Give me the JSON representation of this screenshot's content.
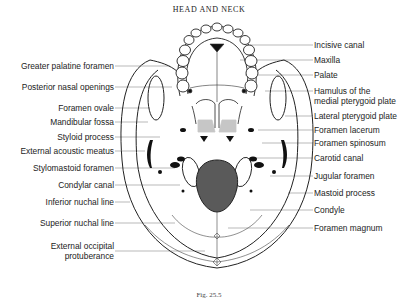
{
  "header": {
    "title": "HEAD AND NECK"
  },
  "caption": "Fig. 25.5",
  "labels_left": [
    {
      "text": "Greater palatine foramen",
      "y": 61
    },
    {
      "text": "Posterior nasal openings",
      "y": 82
    },
    {
      "text": "Foramen ovale",
      "y": 103
    },
    {
      "text": "Mandibular fossa",
      "y": 117
    },
    {
      "text": "Styloid process",
      "y": 132
    },
    {
      "text": "External acoustic meatus",
      "y": 146
    },
    {
      "text": "Stylomastoid foramen",
      "y": 163
    },
    {
      "text": "Condylar canal",
      "y": 180
    },
    {
      "text": "Inferior nuchal line",
      "y": 197
    },
    {
      "text": "Superior nuchal line",
      "y": 218
    },
    {
      "text": "External occipital",
      "y": 241
    },
    {
      "text": "protuberance",
      "y": 251
    }
  ],
  "labels_right": [
    {
      "text": "Incisive canal",
      "y": 40
    },
    {
      "text": "Maxilla",
      "y": 55
    },
    {
      "text": "Palate",
      "y": 70
    },
    {
      "text": "Hamulus of the",
      "y": 86
    },
    {
      "text": "medial pterygoid plate",
      "y": 96
    },
    {
      "text": "Lateral pterygoid plate",
      "y": 111
    },
    {
      "text": "Foramen lacerum",
      "y": 125
    },
    {
      "text": "Foramen spinosum",
      "y": 138
    },
    {
      "text": "Carotid canal",
      "y": 153
    },
    {
      "text": "Jugular foramen",
      "y": 171
    },
    {
      "text": "Mastoid process",
      "y": 188
    },
    {
      "text": "Condyle",
      "y": 205
    },
    {
      "text": "Foramen magnum",
      "y": 223
    }
  ],
  "colors": {
    "line": "#222222",
    "foramen_magnum_fill": "#555555",
    "leader": "#777777"
  }
}
